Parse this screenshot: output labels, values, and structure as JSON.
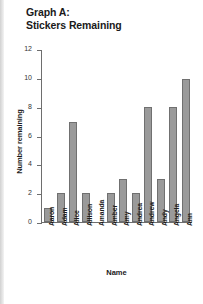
{
  "title": {
    "line1": "Graph A:",
    "line2": "Stickers Remaining"
  },
  "chart_data": {
    "type": "bar",
    "title": "Graph A: Stickers Remaining",
    "xlabel": "Name",
    "ylabel": "Number remaining",
    "categories": [
      "Aaron",
      "Adam",
      "Alice",
      "Allison",
      "Amanda",
      "Amber",
      "Amy",
      "Andrea",
      "Andrew",
      "Andy",
      "Angela",
      "Ann"
    ],
    "values": [
      1,
      2,
      7,
      2,
      0,
      2,
      3,
      2,
      8,
      3,
      8,
      10
    ],
    "ylim": [
      0,
      12
    ],
    "yticks": [
      0,
      2,
      4,
      6,
      8,
      10,
      12
    ],
    "ytick_labels": [
      "0",
      "2",
      "4",
      "6",
      "8",
      "10",
      "12"
    ],
    "grid": false,
    "legend": false,
    "bar_color": "#9a9a9a",
    "bar_edge_color": "#707070",
    "axis_color": "#6e6e6e"
  }
}
